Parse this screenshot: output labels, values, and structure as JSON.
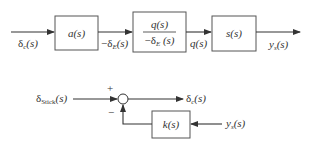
{
  "top_loop": {
    "input_label": "δ_c(s)",
    "blocks": [
      {
        "id": "a",
        "label": "a(s)"
      },
      {
        "id": "q_over_deltaE",
        "numerator": "q(s)",
        "denominator": "−δ_E(s)"
      },
      {
        "id": "s",
        "label": "s(s)"
      }
    ],
    "signals": {
      "input": {
        "main": "δ",
        "sub": "c",
        "rest": "(s)"
      },
      "after_a": {
        "prefix": "−δ",
        "sub": "E",
        "rest": "(s)"
      },
      "after_q": "q(s)",
      "output": {
        "main": "y",
        "sub": "s",
        "rest": "(s)"
      }
    },
    "fraction": {
      "numerator": "q(s)",
      "den_prefix": "−δ",
      "den_sub": "E",
      "den_rest": " (s)"
    }
  },
  "bottom_loop": {
    "input": {
      "main": "δ",
      "sub": "Stick",
      "rest": "(s)"
    },
    "sum_signs": {
      "plus": "+",
      "minus": "−"
    },
    "output": {
      "main": "δ",
      "sub": "c",
      "rest": "(s)"
    },
    "feedback_block": "k(s)",
    "feedback_input": {
      "main": "y",
      "sub": "s",
      "rest": "(s)"
    }
  },
  "colors": {
    "line": "#333333",
    "box_stroke": "#555555",
    "background": "#ffffff"
  }
}
